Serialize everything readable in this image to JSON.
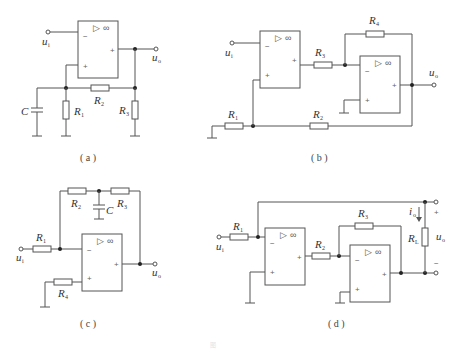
{
  "figure": {
    "caption_faint": "图",
    "colors": {
      "wire": "#555555",
      "node": "#222222",
      "text": "#333333",
      "background": "#ffffff"
    }
  },
  "panels": [
    {
      "id": "a",
      "caption": "( a )",
      "labels": {
        "input": "u",
        "input_sub": "i",
        "output": "u",
        "output_sub": "o",
        "R1": "R",
        "R1_sub": "1",
        "R2": "R",
        "R2_sub": "2",
        "R3": "R",
        "R3_sub": "3",
        "C": "C"
      },
      "opamp": {
        "minus": "−",
        "plus": "+",
        "out": "+",
        "symbol": "▷",
        "gain": "∞"
      }
    },
    {
      "id": "b",
      "caption": "( b )",
      "labels": {
        "input": "u",
        "input_sub": "i",
        "output": "u",
        "output_sub": "o",
        "R1": "R",
        "R1_sub": "1",
        "R2": "R",
        "R2_sub": "2",
        "R3": "R",
        "R3_sub": "3",
        "R4": "R",
        "R4_sub": "4"
      },
      "opamp": {
        "minus": "−",
        "plus": "+",
        "out": "+",
        "symbol": "▷",
        "gain": "∞"
      }
    },
    {
      "id": "c",
      "caption": "( c )",
      "labels": {
        "input": "u",
        "input_sub": "i",
        "output": "u",
        "output_sub": "o",
        "R1": "R",
        "R1_sub": "1",
        "R2": "R",
        "R2_sub": "2",
        "R3": "R",
        "R3_sub": "3",
        "R4": "R",
        "R4_sub": "4",
        "C": "C"
      },
      "opamp": {
        "minus": "−",
        "plus": "+",
        "out": "+",
        "symbol": "▷",
        "gain": "∞"
      }
    },
    {
      "id": "d",
      "caption": "( d )",
      "labels": {
        "input": "u",
        "input_sub": "i",
        "output": "u",
        "output_sub": "o",
        "R1": "R",
        "R1_sub": "1",
        "R2": "R",
        "R2_sub": "2",
        "R3": "R",
        "R3_sub": "3",
        "RL": "R",
        "RL_sub": "L",
        "current": "i",
        "current_sub": "o",
        "plus_term": "+",
        "minus_term": "−"
      },
      "opamp": {
        "minus": "−",
        "plus": "+",
        "out": "+",
        "symbol": "▷",
        "gain": "∞"
      }
    }
  ]
}
